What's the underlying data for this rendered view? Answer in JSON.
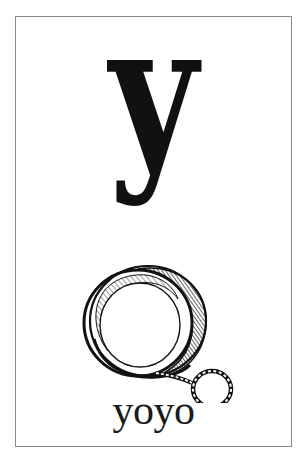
{
  "card": {
    "letter": "y",
    "word": "yoyo",
    "illustration": {
      "subject": "yoyo-icon",
      "description": "Pen-and-ink drawing of a yo-yo with a looped string"
    },
    "colors": {
      "background": "#ffffff",
      "border": "#8a8a8a",
      "ink": "#111111"
    }
  }
}
